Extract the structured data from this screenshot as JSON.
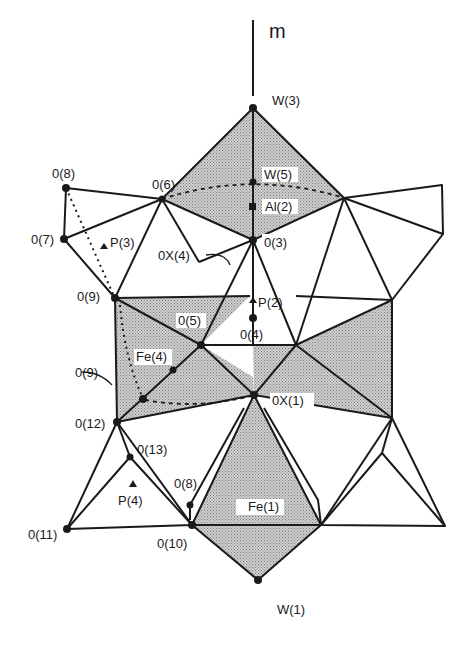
{
  "figure": {
    "mirror_label": "m",
    "colors": {
      "line": "#1a1a1a",
      "shade": "#b8b8b8",
      "background": "#ffffff"
    }
  },
  "atoms": {
    "W3": "W(3)",
    "W5": "W(5)",
    "Al2": "Al(2)",
    "O3": "0(3)",
    "O6": "0(6)",
    "O7": "0(7)",
    "O8_top": "0(8)",
    "P3": "P(3)",
    "OX4": "0X(4)",
    "O9_top": "0(9)",
    "P2": "P(2)",
    "O5": "0(5)",
    "O4": "0(4)",
    "Fe4": "Fe(4)",
    "O9_mid": "0(9)",
    "OX1": "0X(1)",
    "O12": "0(12)",
    "O13": "0(13)",
    "P4": "P(4)",
    "O8_bottom": "0(8)",
    "Fe1": "Fe(1)",
    "O11": "0(11)",
    "O10": "0(10)",
    "W1": "W(1)"
  }
}
